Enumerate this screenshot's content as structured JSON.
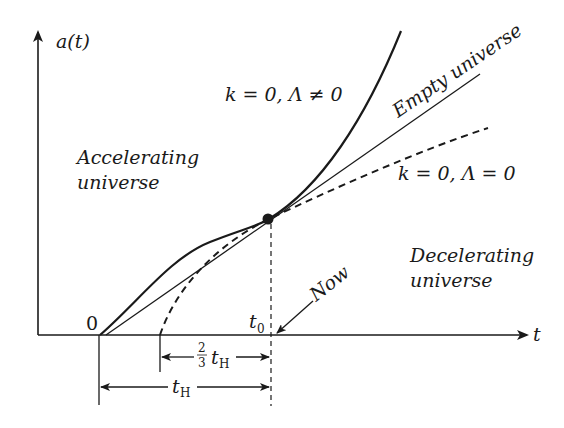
{
  "diagram": {
    "type": "cosmology-scale-factor-plot",
    "axes": {
      "y_label": "a(t)",
      "x_label": "t",
      "origin_label": "0",
      "t0_label": "t",
      "t0_sub": "0"
    },
    "curves": [
      {
        "id": "accelerating",
        "label": "k = 0, Λ ≠ 0",
        "style": "solid-thick"
      },
      {
        "id": "empty",
        "label": "Empty universe",
        "style": "solid-thin"
      },
      {
        "id": "matter",
        "label": "k = 0, Λ = 0",
        "style": "dashed"
      }
    ],
    "region_labels": {
      "accelerating_line1": "Accelerating",
      "accelerating_line2": "universe",
      "decelerating_line1": "Decelerating",
      "decelerating_line2": "universe"
    },
    "now_label": "Now",
    "intervals": {
      "two_thirds_num": "2",
      "two_thirds_den": "3",
      "t_h": "t",
      "t_h_sub": "H"
    },
    "colors": {
      "ink": "#1a1a1a",
      "background": "#ffffff"
    }
  }
}
